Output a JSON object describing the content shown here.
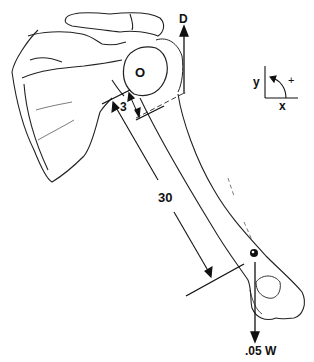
{
  "diagram": {
    "labels": {
      "force_d": "D",
      "origin": "O",
      "short_distance": "3",
      "long_distance": "30",
      "weight_force": ".05 W",
      "axis_y": "y",
      "axis_x": "x",
      "rotation_sign": "+"
    },
    "colors": {
      "line": "#111111",
      "background": "#ffffff"
    }
  }
}
